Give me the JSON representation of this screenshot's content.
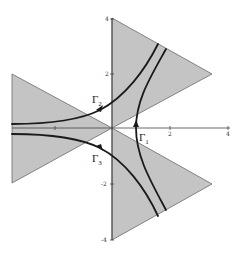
{
  "figure": {
    "colors": {
      "wedge_fill": "#c4c4c4",
      "wedge_edge": "#6a6a6a",
      "curve": "#1a1a1a",
      "axis": "#444444"
    },
    "axes": {
      "x_ticks": [
        {
          "value": 2,
          "label": "2"
        },
        {
          "value": 4,
          "label": "4"
        }
      ],
      "y_ticks": [
        {
          "value": 4,
          "label": "4"
        },
        {
          "value": 2,
          "label": "2"
        },
        {
          "value": -2,
          "label": "-2"
        },
        {
          "value": -4,
          "label": "-4"
        }
      ],
      "x_range": [
        -3.5,
        4
      ],
      "y_range": [
        -4,
        4
      ]
    },
    "labels": {
      "gamma1": {
        "base": "Γ",
        "sub": "1"
      },
      "gamma2": {
        "base": "Γ",
        "sub": "2"
      },
      "gamma3": {
        "base": "Γ",
        "sub": "3"
      }
    },
    "wedges": [
      {
        "name": "upper-right",
        "vertices": [
          [
            0,
            0
          ],
          [
            0,
            4
          ],
          [
            3.5,
            2
          ]
        ]
      },
      {
        "name": "left",
        "vertices": [
          [
            0,
            0
          ],
          [
            -3.5,
            2
          ],
          [
            -3.5,
            -2
          ]
        ]
      },
      {
        "name": "lower-right",
        "vertices": [
          [
            0,
            0
          ],
          [
            3.5,
            -2
          ],
          [
            0,
            -4
          ]
        ]
      }
    ]
  }
}
